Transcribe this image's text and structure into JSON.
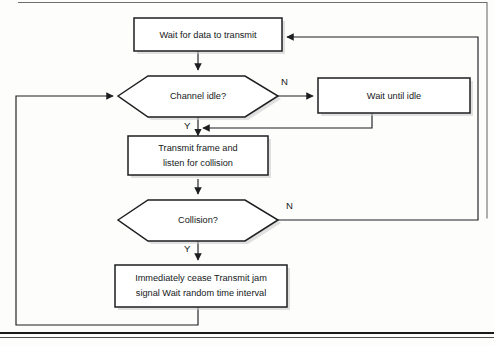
{
  "document": {
    "title": "CSMA/CD Transmission Flowchart",
    "page_frame": {
      "top_border": true,
      "right_border": true,
      "left_border": false,
      "bottom_rule": true,
      "frame_color": "#6f6f70",
      "rule_color": "#1a1a1a"
    }
  },
  "diagram": {
    "type": "flowchart",
    "accent_color": "#1c1e20",
    "shape_fill": "#ffffff",
    "shadow_color": "#c9c9c9",
    "nodes": [
      {
        "id": "wait-for-data",
        "shape": "process",
        "lines": [
          "Wait for data to transmit"
        ],
        "x": 134,
        "y": 18,
        "w": 148,
        "h": 33
      },
      {
        "id": "channel-idle",
        "shape": "decision",
        "lines": [
          "Channel idle?"
        ],
        "x": 118,
        "y": 75,
        "w": 160,
        "h": 42
      },
      {
        "id": "wait-until-idle",
        "shape": "process",
        "lines": [
          "Wait until idle"
        ],
        "x": 318,
        "y": 78,
        "w": 152,
        "h": 35
      },
      {
        "id": "transmit-frame",
        "shape": "process",
        "lines": [
          "Transmit frame and",
          "listen for collision"
        ],
        "x": 128,
        "y": 140,
        "w": 140,
        "h": 39
      },
      {
        "id": "collision",
        "shape": "decision",
        "lines": [
          "Collision?"
        ],
        "x": 118,
        "y": 199,
        "w": 160,
        "h": 42
      },
      {
        "id": "cease-transmit",
        "shape": "process",
        "lines": [
          "Immediately cease Transmit jam",
          "signal Wait random time interval"
        ],
        "x": 115,
        "y": 265,
        "w": 172,
        "h": 42
      }
    ],
    "branch_labels": [
      {
        "id": "channel-idle-no",
        "text": "N",
        "x": 281,
        "y": 85
      },
      {
        "id": "channel-idle-yes",
        "text": "Y",
        "x": 184,
        "y": 129
      },
      {
        "id": "collision-no",
        "text": "N",
        "x": 286,
        "y": 209
      },
      {
        "id": "collision-yes",
        "text": "Y",
        "x": 184,
        "y": 252
      }
    ],
    "edges": [
      {
        "id": "edge-wait-to-channel",
        "from": "wait-for-data",
        "to": "channel-idle",
        "label": ""
      },
      {
        "id": "edge-channel-no-to-waitidle",
        "from": "channel-idle",
        "to": "wait-until-idle",
        "label": "N"
      },
      {
        "id": "edge-waitidle-back-to-transmit",
        "from": "wait-until-idle",
        "to": "transmit-frame",
        "label": ""
      },
      {
        "id": "edge-channel-yes-to-transmit",
        "from": "channel-idle",
        "to": "transmit-frame",
        "label": "Y"
      },
      {
        "id": "edge-transmit-to-collision",
        "from": "transmit-frame",
        "to": "collision",
        "label": ""
      },
      {
        "id": "edge-collision-no-to-wait-for-data",
        "from": "collision",
        "to": "wait-for-data",
        "label": "N"
      },
      {
        "id": "edge-collision-yes-to-cease",
        "from": "collision",
        "to": "cease-transmit",
        "label": "Y"
      },
      {
        "id": "edge-cease-back-to-channel",
        "from": "cease-transmit",
        "to": "channel-idle",
        "label": ""
      }
    ]
  }
}
